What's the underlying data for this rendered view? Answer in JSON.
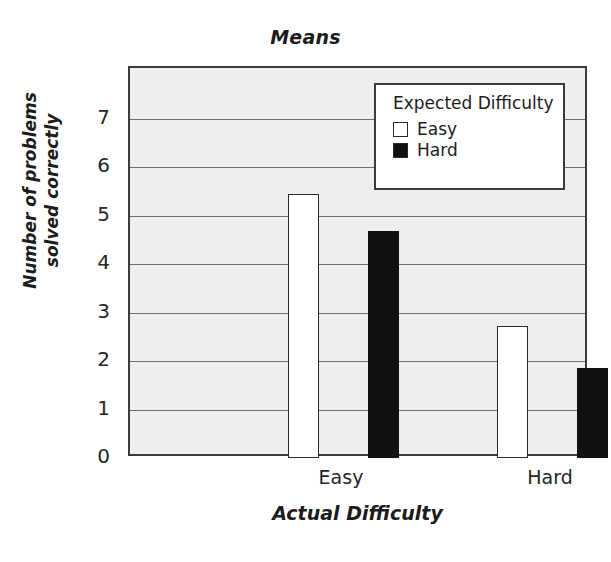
{
  "chart_data": {
    "type": "bar",
    "title": "Means",
    "xlabel": "Actual Difficulty",
    "ylabel": "Number of problems solved correctly",
    "categories": [
      "Easy",
      "Hard"
    ],
    "series": [
      {
        "name": "Easy",
        "values": [
          5.45,
          2.73
        ],
        "color": "#ffffff"
      },
      {
        "name": "Hard",
        "values": [
          4.69,
          1.86
        ],
        "color": "#111111"
      }
    ],
    "ylim": [
      0,
      8.05
    ],
    "yticks": [
      0,
      1,
      2,
      3,
      4,
      5,
      6,
      7
    ],
    "ytick_labels": [
      "0",
      "1",
      "2",
      "3",
      "4",
      "5",
      "6",
      "7"
    ],
    "grid": true,
    "grid_axis": "y",
    "legend_title": "Expected Difficulty",
    "legend_entries": [
      "Easy",
      "Hard"
    ],
    "legend_position": "top-right",
    "plot_background": "#eeeeee",
    "grid_color": "#6e6e6e",
    "frame_color": "#3b3b3b"
  },
  "ylabel_lines": {
    "line1": "Number of problems",
    "line2": "solved correctly"
  }
}
